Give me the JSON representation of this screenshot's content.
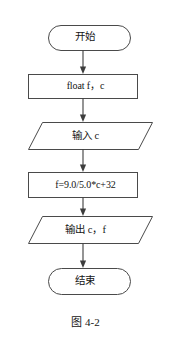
{
  "figure": {
    "caption": "图 4-2",
    "background_color": "#ffffff",
    "stroke_color": "#4a4a4a",
    "text_color": "#141414"
  },
  "flowchart": {
    "type": "flowchart",
    "orientation": "top-to-bottom",
    "nodes": [
      {
        "id": "start",
        "shape": "terminator",
        "label": "开始"
      },
      {
        "id": "declare",
        "shape": "process",
        "label": "float f，c"
      },
      {
        "id": "input",
        "shape": "parallelogram",
        "label": "输入 c"
      },
      {
        "id": "compute",
        "shape": "process",
        "label": "f=9.0/5.0*c+32"
      },
      {
        "id": "output",
        "shape": "parallelogram",
        "label": "输出 c，f"
      },
      {
        "id": "end",
        "shape": "terminator",
        "label": "结束"
      }
    ],
    "edges": [
      {
        "from": "start",
        "to": "declare"
      },
      {
        "from": "declare",
        "to": "input"
      },
      {
        "from": "input",
        "to": "compute"
      },
      {
        "from": "compute",
        "to": "output"
      },
      {
        "from": "output",
        "to": "end"
      }
    ]
  }
}
